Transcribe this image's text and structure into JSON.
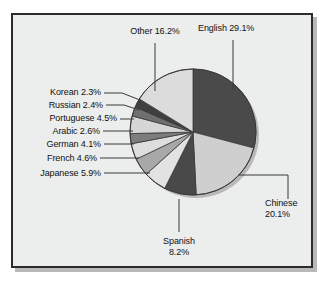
{
  "chart_data": {
    "type": "pie",
    "title": "",
    "subtitle": "",
    "xlabel": "",
    "ylabel": "",
    "legend_position": "none",
    "grid": false,
    "units": "%",
    "start_angle_deg": 0,
    "direction": "clockwise",
    "categories": [
      "English",
      "Chinese",
      "Spanish",
      "Japanese",
      "French",
      "German",
      "Arabic",
      "Portuguese",
      "Russian",
      "Korean",
      "Other"
    ],
    "values": [
      29.1,
      20.1,
      8.2,
      5.9,
      4.6,
      4.1,
      2.6,
      4.5,
      2.4,
      2.3,
      16.2
    ],
    "slices": [
      {
        "label": "English",
        "value": 29.1,
        "text": "English 29.1%",
        "color": "#4a4a4a"
      },
      {
        "label": "Chinese",
        "value": 20.1,
        "text": "Chinese",
        "text2": "20.1%",
        "color": "#cfcfcf"
      },
      {
        "label": "Spanish",
        "value": 8.2,
        "text": "Spanish",
        "text2": "8.2%",
        "color": "#494949"
      },
      {
        "label": "Japanese",
        "value": 5.9,
        "text": "Japanese 5.9%",
        "color": "#e2e2e2"
      },
      {
        "label": "French",
        "value": 4.6,
        "text": "French 4.6%",
        "color": "#a8a8a8"
      },
      {
        "label": "German",
        "value": 4.1,
        "text": "German 4.1%",
        "color": "#dedede"
      },
      {
        "label": "Arabic",
        "value": 2.6,
        "text": "Arabic 2.6%",
        "color": "#7d7d7d"
      },
      {
        "label": "Portuguese",
        "value": 4.5,
        "text": "Portuguese 4.5%",
        "color": "#d6d6d6"
      },
      {
        "label": "Russian",
        "value": 2.4,
        "text": "Russian 2.4%",
        "color": "#6f6f6f"
      },
      {
        "label": "Korean",
        "value": 2.3,
        "text": "Korean 2.3%",
        "color": "#3f3f3f"
      },
      {
        "label": "Other",
        "value": 16.2,
        "text": "Other 16.2%",
        "color": "#dcdcdc"
      }
    ]
  },
  "labels": {
    "other": "Other 16.2%",
    "english": "English 29.1%",
    "korean": "Korean 2.3%",
    "russian": "Russian 2.4%",
    "portuguese": "Portuguese 4.5%",
    "arabic": "Arabic 2.6%",
    "german": "German 4.1%",
    "french": "French 4.6%",
    "japanese": "Japanese 5.9%",
    "spanish_name": "Spanish",
    "spanish_value": "8.2%",
    "chinese_name": "Chinese",
    "chinese_value": "20.1%"
  },
  "colors": {
    "frame_border": "#2b2b2b",
    "frame_fill": "#eceded",
    "page_background": "#ffffff",
    "leader_line": "#3a3a3a",
    "slice_outline": "#3a3a3a",
    "text": "#111111"
  }
}
